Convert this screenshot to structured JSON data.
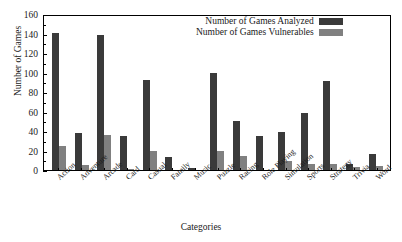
{
  "chart_data": {
    "type": "bar",
    "title": "",
    "xlabel": "Categories",
    "ylabel": "Number of Games",
    "ylim": [
      0,
      160
    ],
    "yticks": [
      0,
      20,
      40,
      60,
      80,
      100,
      120,
      140,
      160
    ],
    "grid": false,
    "legend_position": "top-right",
    "categories": [
      "Action",
      "Adventure",
      "Arcade",
      "Card",
      "Casual",
      "Family",
      "Music",
      "Puzzle",
      "Racing",
      "Role Playing",
      "Simulation",
      "Sports",
      "Strategy",
      "Trivia",
      "Word"
    ],
    "series": [
      {
        "name": "Number of Games Analyzed",
        "color": "#3a3a3a",
        "values": [
          141,
          38,
          138,
          35,
          92,
          13,
          2,
          99,
          50,
          35,
          39,
          58,
          91,
          6,
          16
        ]
      },
      {
        "name": "Number of Games Vulnerables",
        "color": "#808080",
        "values": [
          25,
          5,
          36,
          1,
          19,
          0,
          0,
          20,
          14,
          0,
          9,
          6,
          6,
          3,
          4
        ]
      }
    ]
  }
}
